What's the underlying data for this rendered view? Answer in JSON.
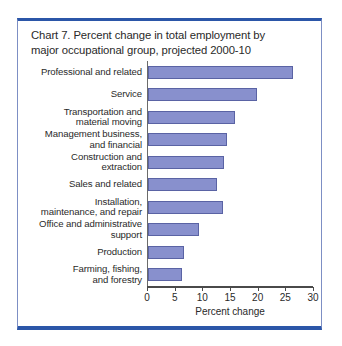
{
  "frame": {
    "border_color": "#7d8fc4",
    "edge_color": "#2b56a8"
  },
  "title": {
    "line1": "Chart 7. Percent change in total employment by",
    "line2": "major occupational group, projected 2000-10"
  },
  "axis": {
    "xlabel": "Percent change",
    "ticks": [
      "0",
      "5",
      "10",
      "15",
      "20",
      "25",
      "30"
    ]
  },
  "colors": {
    "bar_fill": "#8890cd",
    "bar_stroke": "#5a63a4",
    "axis": "#4a4a4a",
    "text": "#2a2a2a"
  },
  "chart_data": {
    "type": "bar",
    "orientation": "horizontal",
    "title": "Chart 7. Percent change in total employment by major occupational group, projected 2000-10",
    "xlabel": "Percent change",
    "ylabel": "",
    "xlim": [
      0,
      30
    ],
    "xticks": [
      0,
      5,
      10,
      15,
      20,
      25,
      30
    ],
    "grid": false,
    "legend": null,
    "categories": [
      "Professional and related",
      "Service",
      "Transportation and material moving",
      "Management business, and financial",
      "Construction and extraction",
      "Sales and related",
      "Installation, maintenance, and repair",
      "Office and administrative support",
      "Production",
      "Farming, fishing, and forestry"
    ],
    "values": [
      26.2,
      19.7,
      15.8,
      14.2,
      13.8,
      12.5,
      13.6,
      9.3,
      6.5,
      6.2
    ],
    "category_label_lines": [
      [
        "Professional and related"
      ],
      [
        "Service"
      ],
      [
        "Transportation and",
        "material moving"
      ],
      [
        "Management business,",
        "and financial"
      ],
      [
        "Construction and",
        "extraction"
      ],
      [
        "Sales and related"
      ],
      [
        "Installation,",
        "maintenance, and repair"
      ],
      [
        "Office and administrative",
        "support"
      ],
      [
        "Production"
      ],
      [
        "Farming, fishing,",
        "and forestry"
      ]
    ]
  }
}
